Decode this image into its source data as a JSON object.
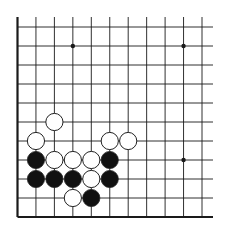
{
  "diagram": {
    "type": "go-board-fragment",
    "colors": {
      "background": "#ffffff",
      "line": "#1a1a1a",
      "black_stone": "#111111",
      "white_stone": "#ffffff",
      "stone_outline": "#222222"
    },
    "grid": {
      "cols": 11,
      "rows": 11,
      "origin_x": 17.5,
      "origin_y": 217,
      "spacing_x": 18.45,
      "spacing_y": 19,
      "left_edge": true,
      "bottom_edge": true,
      "left_edge_top_y": 17,
      "right_extent_x": 213
    },
    "star_points": [
      {
        "col": 3,
        "row": 9
      },
      {
        "col": 9,
        "row": 9
      },
      {
        "col": 9,
        "row": 3
      }
    ],
    "stones": [
      {
        "color": "white",
        "col": 2,
        "row": 5
      },
      {
        "color": "white",
        "col": 1,
        "row": 4
      },
      {
        "color": "white",
        "col": 5,
        "row": 4
      },
      {
        "color": "white",
        "col": 6,
        "row": 4
      },
      {
        "color": "black",
        "col": 1,
        "row": 3
      },
      {
        "color": "white",
        "col": 2,
        "row": 3
      },
      {
        "color": "white",
        "col": 3,
        "row": 3
      },
      {
        "color": "white",
        "col": 4,
        "row": 3
      },
      {
        "color": "black",
        "col": 5,
        "row": 3
      },
      {
        "color": "black",
        "col": 1,
        "row": 2
      },
      {
        "color": "black",
        "col": 2,
        "row": 2
      },
      {
        "color": "black",
        "col": 3,
        "row": 2
      },
      {
        "color": "white",
        "col": 4,
        "row": 2
      },
      {
        "color": "black",
        "col": 5,
        "row": 2
      },
      {
        "color": "white",
        "col": 3,
        "row": 1
      },
      {
        "color": "black",
        "col": 4,
        "row": 1
      }
    ]
  }
}
